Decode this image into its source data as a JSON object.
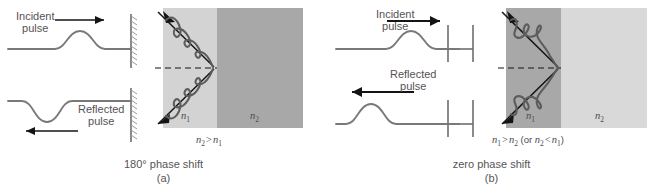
{
  "figure": {
    "colors": {
      "page_background": "#ffffff",
      "line": "#6f6c6e",
      "ray": "#141414",
      "wave": "#5e5b5d",
      "medium_light": "#d3d3d3",
      "medium_dark": "#a8a8a8",
      "text": "#555254"
    }
  },
  "panels": [
    {
      "id": "a",
      "caption_main": "180° phase shift",
      "caption_sub": "(a)",
      "rope": {
        "boundary_type": "fixed-end",
        "boundary_icon": "hatched-wall-icon",
        "incident_label_line1": "Incident",
        "incident_label_line2": "pulse",
        "incident_arrow_direction": "right",
        "incident_pulse_polarity": "up",
        "reflected_label_line1": "Reflected",
        "reflected_label_line2": "pulse",
        "reflected_arrow_direction": "left",
        "reflected_pulse_polarity": "down"
      },
      "optics": {
        "left_medium_label": "n",
        "left_medium_sub": "1",
        "right_medium_label": "n",
        "right_medium_sub": "2",
        "left_medium_shade": "light",
        "right_medium_shade": "dark",
        "relation": "n2 > n1",
        "normal_line_style": "dashed",
        "incident_ray_label": "incident-ray",
        "reflected_ray_label": "reflected-ray"
      }
    },
    {
      "id": "b",
      "caption_main": "zero phase shift",
      "caption_sub": "(b)",
      "rope": {
        "boundary_type": "free-end",
        "boundary_icon": "free-end-bracket-icon",
        "incident_label_line1": "Incident",
        "incident_label_line2": "pulse",
        "incident_arrow_direction": "right",
        "incident_pulse_polarity": "up",
        "reflected_label_line1": "Reflected",
        "reflected_label_line2": "pulse",
        "reflected_arrow_direction": "left",
        "reflected_pulse_polarity": "up"
      },
      "optics": {
        "left_medium_label": "n",
        "left_medium_sub": "1",
        "right_medium_label": "n",
        "right_medium_sub": "2",
        "left_medium_shade": "dark",
        "right_medium_shade": "light",
        "relation": "n1 > n2 (or n2 < n1)",
        "normal_line_style": "dashed",
        "incident_ray_label": "incident-ray",
        "reflected_ray_label": "reflected-ray"
      }
    }
  ]
}
